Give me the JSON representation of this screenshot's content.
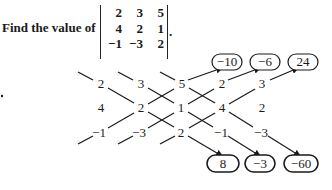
{
  "problem": {
    "prompt": "Find the value of",
    "matrix": [
      [
        "2",
        "3",
        "5"
      ],
      [
        "4",
        "2",
        "1"
      ],
      [
        "-1",
        "-3",
        "2"
      ]
    ],
    "period": "."
  },
  "diagram": {
    "grid": [
      [
        "2",
        "3",
        "5",
        "2",
        "3"
      ],
      [
        "4",
        "2",
        "1",
        "4",
        "2"
      ],
      [
        "−1",
        "−3",
        "2",
        "−1",
        "−3"
      ]
    ],
    "top_products": [
      "−10",
      "−6",
      "24"
    ],
    "bottom_products": [
      "8",
      "−3",
      "−60"
    ]
  },
  "colors": {
    "ink": "#1a1a1a",
    "background": "#ffffff"
  }
}
